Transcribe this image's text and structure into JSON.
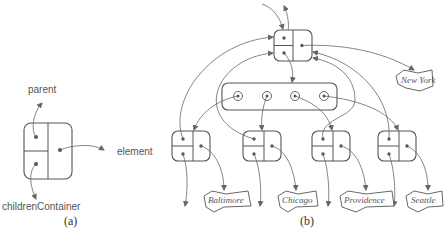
{
  "figure_a": {
    "caption": "(a)",
    "labels": {
      "parent": "parent",
      "element": "element",
      "children": "childrenContainer"
    }
  },
  "figure_b": {
    "caption": "(b)",
    "root_element": "New York",
    "children": [
      "Baltimore",
      "Chicago",
      "Providence",
      "Seattle"
    ]
  }
}
